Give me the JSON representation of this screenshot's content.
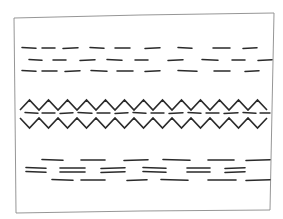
{
  "sketch": {
    "description": "Hand-drawn pencil pattern sketch: framed panel with dashed bands and a double zigzag band",
    "colors": {
      "background": "#ffffff",
      "frame_stroke": "#8a8a8a",
      "ink": "#2a2a2a"
    },
    "frame": {
      "points": [
        [
          14,
          18
        ],
        [
          140,
          15
        ],
        [
          274,
          13
        ],
        [
          272,
          110
        ],
        [
          270,
          210
        ],
        [
          140,
          211
        ],
        [
          16,
          213
        ],
        [
          15,
          110
        ]
      ]
    },
    "top_dash_band": {
      "rows": [
        {
          "y": 48,
          "dashes": [
            [
              22,
              36
            ],
            [
              42,
              55
            ],
            [
              63,
              78
            ],
            [
              90,
              104
            ],
            [
              115,
              130
            ],
            [
              145,
              160
            ],
            [
              178,
              192
            ],
            [
              213,
              230
            ],
            [
              243,
              257
            ]
          ]
        },
        {
          "y": 60,
          "dashes": [
            [
              29,
              42
            ],
            [
              53,
              66
            ],
            [
              80,
              95
            ],
            [
              107,
              122
            ],
            [
              135,
              148
            ],
            [
              168,
              183
            ],
            [
              202,
              218
            ],
            [
              232,
              245
            ],
            [
              258,
              272
            ]
          ]
        },
        {
          "y": 71,
          "dashes": [
            [
              22,
              36
            ],
            [
              42,
              57
            ],
            [
              65,
              80
            ],
            [
              91,
              107
            ],
            [
              117,
              133
            ],
            [
              145,
              160
            ],
            [
              178,
              197
            ],
            [
              214,
              230
            ],
            [
              245,
              259
            ]
          ]
        }
      ]
    },
    "zigzag_band": {
      "upper": {
        "top": 100,
        "bottom": 110,
        "x_start": 20,
        "x_end": 270,
        "period": 19
      },
      "middle_dashes": {
        "y": 113,
        "dashes": [
          [
            25,
            38
          ],
          [
            42,
            55
          ],
          [
            60,
            73
          ],
          [
            78,
            92
          ],
          [
            97,
            110
          ],
          [
            115,
            128
          ],
          [
            133,
            146
          ],
          [
            151,
            164
          ],
          [
            169,
            183
          ],
          [
            188,
            201
          ],
          [
            206,
            219
          ],
          [
            224,
            238
          ],
          [
            243,
            256
          ],
          [
            260,
            270
          ]
        ]
      },
      "lower": {
        "top": 118,
        "bottom": 128,
        "x_start": 20,
        "x_end": 270,
        "period": 19
      }
    },
    "bottom_dash_band": {
      "rows": [
        {
          "y": 160,
          "dashes": [
            [
              42,
              63
            ],
            [
              81,
              105
            ],
            [
              124,
              148
            ],
            [
              163,
              190
            ],
            [
              208,
              234
            ],
            [
              246,
              270
            ]
          ]
        },
        {
          "y": 168,
          "dashes": [
            [
              26,
              46
            ],
            [
              60,
              85
            ],
            [
              101,
              125
            ],
            [
              143,
              166
            ],
            [
              187,
              210
            ],
            [
              225,
              245
            ]
          ]
        },
        {
          "y": 172,
          "dashes": [
            [
              26,
              46
            ],
            [
              60,
              85
            ],
            [
              101,
              125
            ],
            [
              143,
              166
            ],
            [
              187,
              210
            ],
            [
              225,
              245
            ]
          ]
        },
        {
          "y": 180,
          "dashes": [
            [
              52,
              73
            ],
            [
              81,
              105
            ],
            [
              127,
              147
            ],
            [
              161,
              188
            ],
            [
              208,
              236
            ],
            [
              246,
              270
            ]
          ]
        }
      ]
    }
  }
}
